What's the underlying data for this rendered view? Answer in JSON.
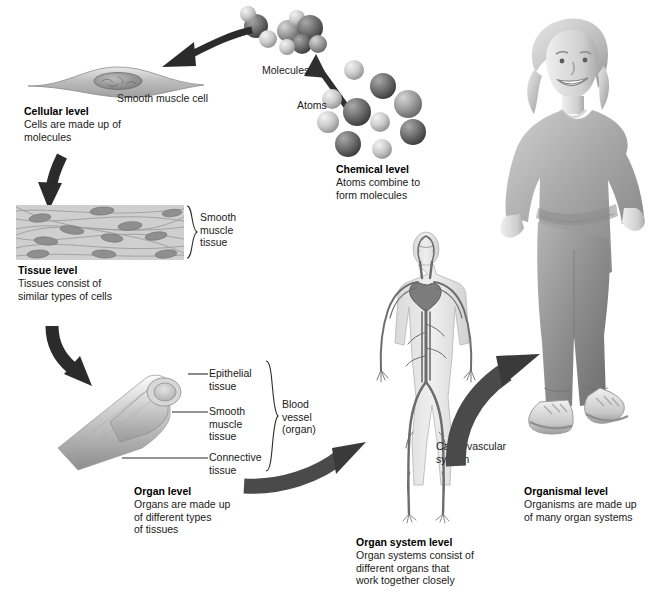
{
  "figure": {
    "background": "#ffffff",
    "ink": "#1a1a1a"
  },
  "levels": [
    {
      "id": "chemical",
      "heading": "Chemical level",
      "body": "Atoms combine to\nform molecules",
      "callouts": [
        "Molecules",
        "Atoms"
      ],
      "x": 336,
      "y": 167
    },
    {
      "id": "cellular",
      "heading": "Cellular level",
      "body": "Cells are made up of\nmolecules",
      "callouts": [
        "Smooth muscle cell"
      ],
      "x": 24,
      "y": 109
    },
    {
      "id": "tissue",
      "heading": "Tissue level",
      "body": "Tissues consist of\nsimilar types of cells",
      "callouts": [
        "Smooth\nmuscle\ntissue"
      ],
      "x": 18,
      "y": 268
    },
    {
      "id": "organ",
      "heading": "Organ level",
      "body": "Organs are made up\nof different types\nof tissues",
      "callouts": [
        "Epithelial\ntissue",
        "Smooth\nmuscle\ntissue",
        "Connective\ntissue",
        "Blood\nvessel\n(organ)"
      ],
      "x": 134,
      "y": 489
    },
    {
      "id": "organ-system",
      "heading": "Organ system level",
      "body": "Organ systems consist of\ndifferent organs that\nwork together closely",
      "callouts": [
        "Cardiovascular\nsystem"
      ],
      "x": 356,
      "y": 540
    },
    {
      "id": "organismal",
      "heading": "Organismal level",
      "body": "Organisms are made up\nof many organ systems",
      "callouts": [],
      "x": 524,
      "y": 489
    }
  ],
  "callouts": {
    "molecules": "Molecules",
    "atoms": "Atoms",
    "smooth_muscle_cell": "Smooth muscle cell",
    "smooth_muscle_tissue": "Smooth\nmuscle\ntissue",
    "epithelial_tissue": "Epithelial\ntissue",
    "organ_smooth_muscle_tissue": "Smooth\nmuscle\ntissue",
    "connective_tissue": "Connective\ntissue",
    "blood_vessel_organ": "Blood\nvessel\n(organ)",
    "cardiovascular_system": "Cardiovascular\nsystem"
  },
  "headings": {
    "chemical": "Chemical level",
    "cellular": "Cellular level",
    "tissue": "Tissue level",
    "organ": "Organ level",
    "organ_system": "Organ system level",
    "organismal": "Organismal level"
  },
  "bodies": {
    "chemical": "Atoms combine to\nform molecules",
    "cellular": "Cells are made up of\nmolecules",
    "tissue": "Tissues consist of\nsimilar types of cells",
    "organ": "Organs are made up\nof different types\nof tissues",
    "organ_system": "Organ systems consist of\ndifferent organs that\nwork together closely",
    "organismal": "Organisms are made up\nof many organ systems"
  },
  "arrows": [
    {
      "id": "atoms-to-molecules",
      "from": "atoms",
      "to": "molecules",
      "direction": "up-left"
    },
    {
      "id": "chemical-to-cellular",
      "from": "chemical",
      "to": "cellular",
      "direction": "left"
    },
    {
      "id": "cellular-to-tissue",
      "from": "cellular",
      "to": "tissue",
      "direction": "down"
    },
    {
      "id": "tissue-to-organ",
      "from": "tissue",
      "to": "organ",
      "direction": "down"
    },
    {
      "id": "organ-to-organ-system",
      "from": "organ",
      "to": "organ-system",
      "direction": "right-up"
    },
    {
      "id": "organ-system-to-organismal",
      "from": "organ-system",
      "to": "organismal",
      "direction": "up-right"
    }
  ],
  "palette": {
    "arrow_dark": "#3b3b3b",
    "arrow_mid": "#6e6e6e",
    "atom_dark": "#6a6a6a",
    "atom_light": "#cfcfcf",
    "tissue_bg": "#c9c9c9",
    "vessel": "#b9b9b9",
    "body_gray": "#9a9a9a"
  }
}
